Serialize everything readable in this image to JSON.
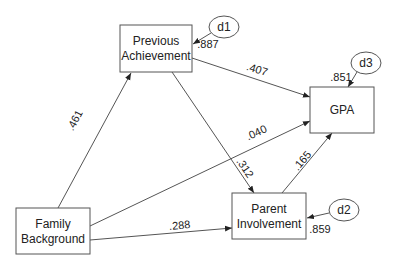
{
  "diagram": {
    "type": "path-model",
    "nodes": {
      "previous_achievement": {
        "line1": "Previous",
        "line2": "Achievement"
      },
      "gpa": {
        "label": "GPA"
      },
      "family_background": {
        "line1": "Family",
        "line2": "Background"
      },
      "parent_involvement": {
        "line1": "Parent",
        "line2": "Involvement"
      }
    },
    "disturbances": {
      "d1": {
        "label": "d1",
        "coef": ".887"
      },
      "d2": {
        "label": "d2",
        "coef": ".859"
      },
      "d3": {
        "label": "d3",
        "coef": ".851"
      }
    },
    "paths": {
      "fb_to_pa": ".461",
      "pa_to_gpa": ".407",
      "fb_to_gpa": ".040",
      "pa_to_pi": ".312",
      "pi_to_gpa": ".165",
      "fb_to_pi": ".288"
    }
  }
}
